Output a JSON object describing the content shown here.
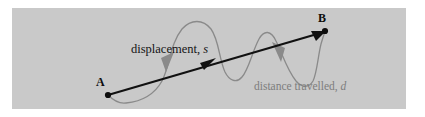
{
  "figure": {
    "name": "displacement-vs-distance-travelled-diagram",
    "background_color": "#ffffff",
    "panel_color": "#c9c9c9",
    "panel": {
      "x": 12,
      "y": 8,
      "width": 394,
      "height": 101
    }
  },
  "points": [
    {
      "id": "A",
      "label": "A",
      "x": 108,
      "y": 95,
      "label_x": 96,
      "label_y": 76,
      "color": "#0d0d0d"
    },
    {
      "id": "B",
      "label": "B",
      "x": 325,
      "y": 31,
      "label_x": 318,
      "label_y": 12,
      "color": "#0d0d0d"
    }
  ],
  "labels": {
    "displacement": {
      "text": "displacement,",
      "symbol": "s",
      "color": "#141414"
    },
    "distance": {
      "text": "distance travelled,",
      "symbol": "d",
      "color": "#7d7d7d"
    }
  },
  "vectors": {
    "displacement_arrow": {
      "name": "displacement-vector-arrow",
      "from": [
        108,
        95
      ],
      "to": [
        325,
        31
      ],
      "color": "#111111",
      "stroke_width": 2.1,
      "midpoint_arrowhead": [
        210,
        62
      ]
    },
    "path_curve": {
      "name": "distance-travelled-path",
      "color": "#8a8a8a",
      "stroke_width": 1.3,
      "arrowheads": [
        {
          "at": [
            170,
            62
          ],
          "direction": "down-left"
        },
        {
          "at": [
            276,
            52
          ],
          "direction": "down-right"
        }
      ],
      "waypoints": [
        [
          108,
          95
        ],
        [
          124,
          103
        ],
        [
          142,
          101
        ],
        [
          158,
          88
        ],
        [
          170,
          66
        ],
        [
          178,
          40
        ],
        [
          190,
          24
        ],
        [
          203,
          23
        ],
        [
          213,
          33
        ],
        [
          219,
          52
        ],
        [
          226,
          72
        ],
        [
          234,
          81
        ],
        [
          241,
          78
        ],
        [
          249,
          62
        ],
        [
          257,
          42
        ],
        [
          264,
          33
        ],
        [
          271,
          36
        ],
        [
          280,
          53
        ],
        [
          291,
          73
        ],
        [
          302,
          85
        ],
        [
          310,
          85
        ],
        [
          315,
          76
        ],
        [
          318,
          58
        ],
        [
          322,
          42
        ],
        [
          325,
          31
        ]
      ]
    }
  }
}
